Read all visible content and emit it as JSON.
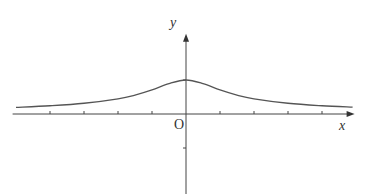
{
  "chart_data": {
    "type": "line",
    "title": "",
    "xlabel": "x",
    "ylabel": "y",
    "origin_label": "O",
    "grid": false,
    "xlim": [
      -5.1,
      4.9
    ],
    "ylim": [
      -2.9,
      2.3
    ],
    "x_ticks": [
      -4,
      -3,
      -2,
      -1,
      1,
      2,
      3,
      4
    ],
    "y_ticks": [
      1,
      -1
    ],
    "x_tick_labels": [],
    "y_tick_labels": [],
    "series": [
      {
        "name": "curve",
        "color": "#555555",
        "x": [
          -5.0,
          -4.0,
          -3.0,
          -2.0,
          -1.5,
          -1.0,
          -0.5,
          0.0,
          0.5,
          1.0,
          1.5,
          2.0,
          3.0,
          4.0,
          4.9
        ],
        "values": [
          0.196,
          0.243,
          0.316,
          0.447,
          0.555,
          0.707,
          0.894,
          1.0,
          0.894,
          0.707,
          0.555,
          0.447,
          0.316,
          0.243,
          0.2
        ]
      }
    ]
  },
  "labels": {
    "y_axis": "y",
    "x_axis": "x",
    "origin": "O"
  }
}
